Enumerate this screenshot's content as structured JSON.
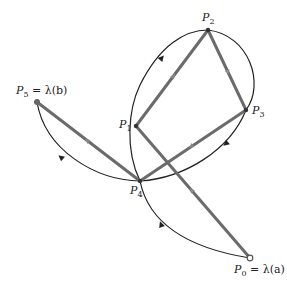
{
  "diagram": {
    "type": "polygonal path approximating a curve",
    "colors": {
      "polygon": "#6b6b6b",
      "curve": "#222222",
      "background": "#ffffff"
    },
    "points": [
      {
        "id": "P0",
        "label_base": "P",
        "label_sub": "0",
        "label_suffix": " = λ(a)",
        "x": 250,
        "y": 258
      },
      {
        "id": "P1",
        "label_base": "P",
        "label_sub": "1",
        "label_suffix": "",
        "x": 136,
        "y": 126
      },
      {
        "id": "P2",
        "label_base": "P",
        "label_sub": "2",
        "label_suffix": "",
        "x": 208,
        "y": 30
      },
      {
        "id": "P3",
        "label_base": "P",
        "label_sub": "3",
        "label_suffix": "",
        "x": 246,
        "y": 110
      },
      {
        "id": "P4",
        "label_base": "P",
        "label_sub": "4",
        "label_suffix": "",
        "x": 140,
        "y": 181
      },
      {
        "id": "P5",
        "label_base": "P",
        "label_sub": "5",
        "label_suffix": " = λ(b)",
        "x": 37,
        "y": 102
      }
    ],
    "polygon_order": [
      "P0",
      "P1",
      "P2",
      "P3",
      "P4",
      "P5"
    ],
    "curve_segments": [
      "P0→P4",
      "P4→P1→P2",
      "P2→P3→P4",
      "P4→P5"
    ]
  }
}
